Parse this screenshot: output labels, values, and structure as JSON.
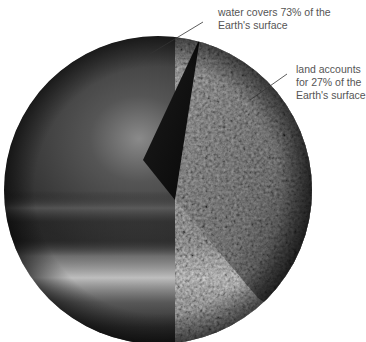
{
  "diagram": {
    "labels": {
      "water": {
        "line1": "water covers 73% of the",
        "line2": "Earth's surface"
      },
      "land": {
        "line1": "land accounts",
        "line2": "for 27% of the",
        "line3": "Earth's surface"
      }
    },
    "proportions": {
      "water_percent": 73,
      "land_percent": 27
    },
    "colors": {
      "background": "#ffffff",
      "label_text": "#555555",
      "leader_line": "#333333",
      "water_dark": "#2a2a2a",
      "water_highlight": "#8a8a8a",
      "land_texture": "#4a4a4a",
      "cut_face": "#0e0e0e"
    }
  }
}
